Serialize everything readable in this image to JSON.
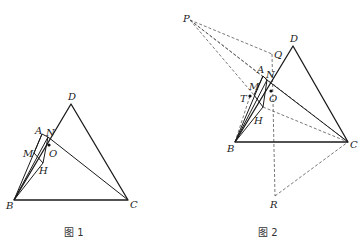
{
  "figures": [
    {
      "caption": "图 1",
      "points": {
        "A": {
          "label": "A",
          "x": 42,
          "y": 134
        },
        "N": {
          "label": "N",
          "x": 48,
          "y": 137
        },
        "O": {
          "label": "O",
          "x": 49,
          "y": 145
        },
        "M": {
          "label": "M",
          "x": 34,
          "y": 153
        },
        "H": {
          "label": "H",
          "x": 43,
          "y": 163
        },
        "B": {
          "label": "B",
          "x": 14,
          "y": 200
        },
        "C": {
          "label": "C",
          "x": 128,
          "y": 200
        },
        "D": {
          "label": "D",
          "x": 71,
          "y": 104
        }
      },
      "solid_segments": [
        [
          "B",
          "C"
        ],
        [
          "C",
          "D"
        ],
        [
          "D",
          "B"
        ],
        [
          "B",
          "A"
        ],
        [
          "A",
          "N"
        ],
        [
          "N",
          "C"
        ],
        [
          "A",
          "M"
        ],
        [
          "M",
          "H"
        ],
        [
          "H",
          "N"
        ],
        [
          "B",
          "H"
        ],
        [
          "B",
          "N"
        ]
      ]
    },
    {
      "caption": "图 2",
      "points": {
        "P": {
          "label": "P",
          "x": 190,
          "y": 20
        },
        "Q": {
          "label": "Q",
          "x": 272,
          "y": 54
        },
        "D": {
          "label": "D",
          "x": 293,
          "y": 46
        },
        "A": {
          "label": "A",
          "x": 263,
          "y": 76
        },
        "N": {
          "label": "N",
          "x": 267,
          "y": 80
        },
        "M": {
          "label": "M",
          "x": 254,
          "y": 95
        },
        "T": {
          "label": "T",
          "x": 250,
          "y": 96
        },
        "O": {
          "label": "O",
          "x": 271,
          "y": 91
        },
        "H": {
          "label": "H",
          "x": 263,
          "y": 107
        },
        "B": {
          "label": "B",
          "x": 235,
          "y": 142
        },
        "C": {
          "label": "C",
          "x": 348,
          "y": 142
        },
        "R": {
          "label": "R",
          "x": 275,
          "y": 196
        }
      },
      "solid_segments": [
        [
          "B",
          "C"
        ],
        [
          "C",
          "D"
        ],
        [
          "D",
          "B"
        ],
        [
          "B",
          "A"
        ],
        [
          "A",
          "N"
        ],
        [
          "N",
          "C"
        ],
        [
          "A",
          "M"
        ],
        [
          "M",
          "H"
        ],
        [
          "H",
          "N"
        ],
        [
          "B",
          "H"
        ],
        [
          "B",
          "N"
        ]
      ],
      "dashed_segments": [
        [
          "P",
          "Q"
        ],
        [
          "P",
          "M"
        ],
        [
          "P",
          "N"
        ],
        [
          "P",
          "C"
        ],
        [
          "Q",
          "R"
        ],
        [
          "R",
          "C"
        ],
        [
          "H",
          "C"
        ],
        [
          "B",
          "T"
        ]
      ]
    }
  ]
}
